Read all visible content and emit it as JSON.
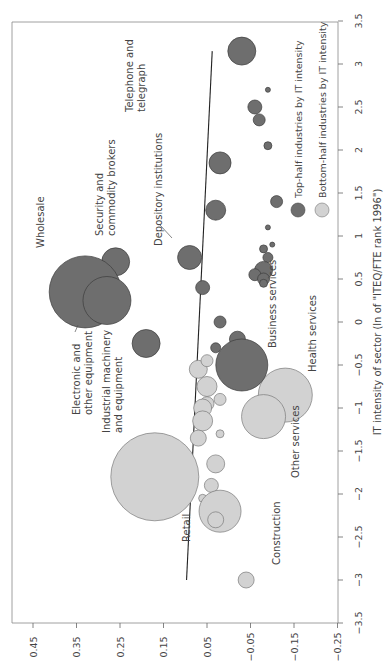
{
  "chart_data": {
    "type": "scatter",
    "subtype": "bubble",
    "orientation": "rotated-90-clockwise",
    "title": "",
    "xlabel": "IT intensity of sector (ln of \"ITEQ/FTE rank 1996\")",
    "ylabel": "",
    "xlim": [
      -3.5,
      3.5
    ],
    "ylim": [
      -0.25,
      0.5
    ],
    "x_ticks": [
      "-3.5",
      "-3",
      "-2.5",
      "-2",
      "-1.5",
      "-1",
      "-0.5",
      "0",
      "0.5",
      "1",
      "1.5",
      "2",
      "2.5",
      "3",
      "3.5"
    ],
    "y_ticks": [
      "0.45",
      "0.35",
      "0.25",
      "0.15",
      "0.05",
      "-0.05",
      "-0.15",
      "-0.25"
    ],
    "grid": false,
    "legend": {
      "position": "right-middle",
      "entries": [
        {
          "label": "Top-half industries by IT intensity",
          "color": "#6e6e6e"
        },
        {
          "label": "Bottom-half industries by IT intensity",
          "color": "#d2d2d2"
        }
      ]
    },
    "trend_line": {
      "x_start": -3.0,
      "y_start": 0.097,
      "x_end": 3.15,
      "y_end": 0.038
    },
    "series": [
      {
        "name": "Top-half industries by IT intensity",
        "color": "#6e6e6e",
        "points": [
          {
            "label": "Telephone and telegraph",
            "x": 3.15,
            "y": -0.03,
            "r": 14
          },
          {
            "label": "",
            "x": 2.7,
            "y": -0.09,
            "r": 2.5
          },
          {
            "label": "",
            "x": 2.5,
            "y": -0.06,
            "r": 7
          },
          {
            "label": "",
            "x": 2.35,
            "y": -0.07,
            "r": 6
          },
          {
            "label": "",
            "x": 2.05,
            "y": -0.09,
            "r": 4
          },
          {
            "label": "",
            "x": 1.85,
            "y": 0.02,
            "r": 11
          },
          {
            "label": "",
            "x": 1.4,
            "y": -0.11,
            "r": 6
          },
          {
            "label": "",
            "x": 1.3,
            "y": 0.03,
            "r": 10
          },
          {
            "label": "",
            "x": 1.1,
            "y": -0.09,
            "r": 2.5
          },
          {
            "label": "Depository institutions",
            "x": 0.75,
            "y": 0.09,
            "r": 12
          },
          {
            "label": "",
            "x": 0.9,
            "y": -0.1,
            "r": 2.5
          },
          {
            "label": "",
            "x": 0.85,
            "y": -0.08,
            "r": 4
          },
          {
            "label": "",
            "x": 0.75,
            "y": -0.09,
            "r": 5
          },
          {
            "label": "",
            "x": 0.6,
            "y": -0.08,
            "r": 9
          },
          {
            "label": "",
            "x": 0.55,
            "y": -0.06,
            "r": 6
          },
          {
            "label": "",
            "x": 0.5,
            "y": -0.08,
            "r": 6
          },
          {
            "label": "",
            "x": 0.45,
            "y": -0.08,
            "r": 4
          },
          {
            "label": "",
            "x": 0.4,
            "y": 0.06,
            "r": 7
          },
          {
            "label": "Security and commodity brokers",
            "x": 0.7,
            "y": 0.26,
            "r": 14
          },
          {
            "label": "Wholesale",
            "x": 0.35,
            "y": 0.33,
            "r": 36
          },
          {
            "label": "Electronic and other equipment",
            "x": 0.25,
            "y": 0.28,
            "r": 24
          },
          {
            "label": "Industrial machinery and equipment",
            "x": -0.25,
            "y": 0.19,
            "r": 14
          },
          {
            "label": "",
            "x": 0.0,
            "y": 0.02,
            "r": 6
          },
          {
            "label": "",
            "x": -0.2,
            "y": -0.02,
            "r": 8
          },
          {
            "label": "",
            "x": -0.3,
            "y": 0.03,
            "r": 5
          },
          {
            "label": "Business services",
            "x": -0.5,
            "y": -0.03,
            "r": 26
          }
        ]
      },
      {
        "name": "Bottom-half industries by IT intensity",
        "color": "#d2d2d2",
        "points": [
          {
            "label": "",
            "x": -0.55,
            "y": 0.07,
            "r": 9
          },
          {
            "label": "",
            "x": -0.45,
            "y": 0.05,
            "r": 6
          },
          {
            "label": "",
            "x": -0.75,
            "y": 0.05,
            "r": 10
          },
          {
            "label": "",
            "x": -0.9,
            "y": 0.02,
            "r": 6
          },
          {
            "label": "",
            "x": -0.95,
            "y": 0.05,
            "r": 7
          },
          {
            "label": "Health services",
            "x": -0.85,
            "y": -0.13,
            "r": 27
          },
          {
            "label": "Other services",
            "x": -1.1,
            "y": -0.08,
            "r": 22
          },
          {
            "label": "",
            "x": -1.0,
            "y": 0.06,
            "r": 9
          },
          {
            "label": "",
            "x": -1.15,
            "y": 0.06,
            "r": 10
          },
          {
            "label": "",
            "x": -1.3,
            "y": 0.02,
            "r": 4
          },
          {
            "label": "",
            "x": -1.35,
            "y": 0.07,
            "r": 8
          },
          {
            "label": "",
            "x": -1.65,
            "y": 0.03,
            "r": 9
          },
          {
            "label": "",
            "x": -1.9,
            "y": 0.04,
            "r": 7
          },
          {
            "label": "Retail",
            "x": -1.8,
            "y": 0.17,
            "r": 44
          },
          {
            "label": "",
            "x": -2.05,
            "y": 0.06,
            "r": 4
          },
          {
            "label": "Construction",
            "x": -2.2,
            "y": 0.02,
            "r": 21
          },
          {
            "label": "",
            "x": -2.3,
            "y": 0.03,
            "r": 8
          },
          {
            "label": "",
            "x": -3.0,
            "y": -0.04,
            "r": 8
          }
        ]
      }
    ]
  },
  "labels": {
    "telephone": [
      "Telephone and",
      "telegraph"
    ],
    "security": [
      "Security and",
      "commodity brokers"
    ],
    "depository": "Depository institutions",
    "wholesale": "Wholesale",
    "electronic": [
      "Electronic and",
      "other equipment"
    ],
    "industrial": [
      "Industrial machinery",
      "and equipment"
    ],
    "business": "Business services",
    "health": "Health services",
    "other": "Other services",
    "retail": "Retail",
    "construction": "Construction"
  },
  "legend": {
    "top": "Top-half industries by IT intensity",
    "bottom": "Bottom-half industries by IT intensity"
  },
  "axis": {
    "it_label": "IT intensity of sector (ln of \"ITEQ/FTE rank 1996\")"
  }
}
